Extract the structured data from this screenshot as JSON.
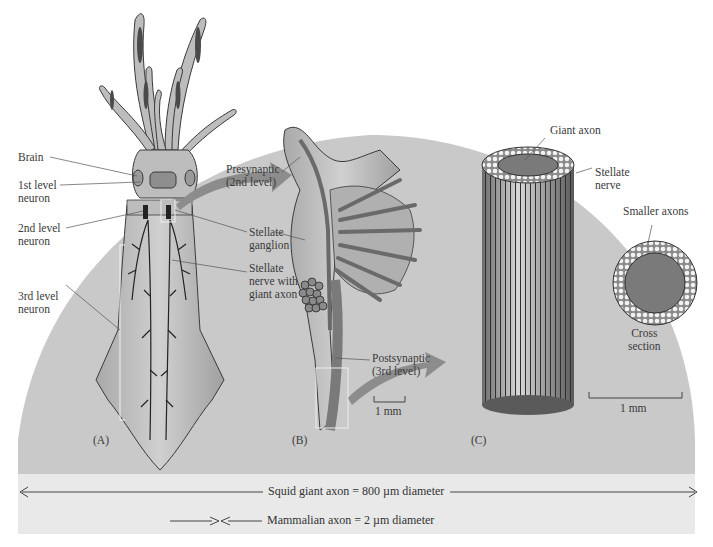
{
  "figure": {
    "background_colors": {
      "dome": "#c9c9c9",
      "band": "#e9e9e9",
      "page": "#ffffff",
      "tissue": "#b5b5b5",
      "axon": "#7a7a7a",
      "arrow": "#8c8c8c"
    },
    "panel_a": {
      "panel_label": "(A)",
      "labels": {
        "brain": "Brain",
        "first_level_1": "1st level",
        "first_level_2": "neuron",
        "second_level_1": "2nd level",
        "second_level_2": "neuron",
        "third_level_1": "3rd level",
        "third_level_2": "neuron",
        "stellate_ganglion_1": "Stellate",
        "stellate_ganglion_2": "ganglion",
        "stellate_nerve_1": "Stellate",
        "stellate_nerve_2": "nerve with",
        "stellate_nerve_3": "giant axon"
      }
    },
    "panel_b": {
      "panel_label": "(B)",
      "labels": {
        "presynaptic_1": "Presynaptic",
        "presynaptic_2": "(2nd level)",
        "postsynaptic_1": "Postsynaptic",
        "postsynaptic_2": "(3rd level)"
      },
      "scale_bar": "1 mm"
    },
    "panel_c": {
      "panel_label": "(C)",
      "labels": {
        "giant_axon": "Giant axon",
        "stellate_nerve_1": "Stellate",
        "stellate_nerve_2": "nerve",
        "smaller_axons": "Smaller axons",
        "cross_section_1": "Cross",
        "cross_section_2": "section"
      },
      "scale_bar": "1 mm"
    },
    "comparison": {
      "squid": "Squid giant axon = 800 µm diameter",
      "mammal": "Mammalian axon = 2 µm diameter"
    }
  }
}
